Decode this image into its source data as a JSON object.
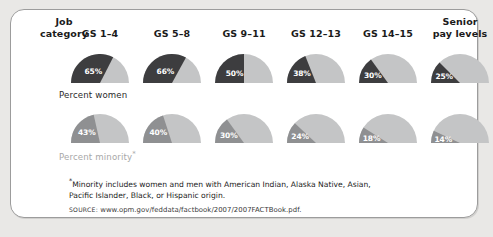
{
  "chart_data": {
    "type": "pie",
    "title": "",
    "subtitle": "",
    "xlabel": "",
    "ylabel": "",
    "categories": [
      "GS 1–4",
      "GS 5–8",
      "GS 9–11",
      "GS 12–13",
      "GS 14–15",
      "Senior pay levels"
    ],
    "series": [
      {
        "name": "Percent women",
        "values": [
          65,
          66,
          50,
          38,
          30,
          25
        ],
        "labels": [
          "65%",
          "66%",
          "50%",
          "38%",
          "30%",
          "25%"
        ],
        "color": "#3d3d3f"
      },
      {
        "name": "Percent minority*",
        "values": [
          43,
          40,
          30,
          24,
          18,
          14
        ],
        "labels": [
          "43%",
          "40%",
          "30%",
          "24%",
          "18%",
          "14%"
        ],
        "color": "#8f9092"
      }
    ],
    "track_color": "#c4c5c6",
    "gauge_shape": "semicircle",
    "gauge_sweep_degrees": 180,
    "gauge_start": "left-horizontal-clockwise",
    "value_units": "percent",
    "ylim": [
      0,
      100
    ],
    "grid": false,
    "legend": "none"
  },
  "card": {
    "background": "#ffffff",
    "border_color": "#9c9c9c",
    "page_background": "#e9e8e6"
  },
  "header": {
    "category_label_line1": "Job",
    "category_label_line2": "category",
    "columns": [
      {
        "line1": "GS 1–4",
        "line2": ""
      },
      {
        "line1": "GS 5–8",
        "line2": ""
      },
      {
        "line1": "GS 9–11",
        "line2": ""
      },
      {
        "line1": "GS 12–13",
        "line2": ""
      },
      {
        "line1": "GS 14–15",
        "line2": ""
      },
      {
        "line1": "Senior",
        "line2": "pay levels"
      }
    ]
  },
  "rows": [
    {
      "label": "Percent women",
      "footnote_marker": "",
      "label_color": "#2a2a2a",
      "wedge_color": "#3d3d3f",
      "cells": [
        {
          "category": "GS 1–4",
          "value": 65,
          "label": "65%"
        },
        {
          "category": "GS 5–8",
          "value": 66,
          "label": "66%"
        },
        {
          "category": "GS 9–11",
          "value": 50,
          "label": "50%"
        },
        {
          "category": "GS 12–13",
          "value": 38,
          "label": "38%"
        },
        {
          "category": "GS 14–15",
          "value": 30,
          "label": "30%"
        },
        {
          "category": "Senior pay levels",
          "value": 25,
          "label": "25%"
        }
      ]
    },
    {
      "label": "Percent minority",
      "footnote_marker": "*",
      "label_color": "#a8a8a8",
      "wedge_color": "#8f9092",
      "cells": [
        {
          "category": "GS 1–4",
          "value": 43,
          "label": "43%"
        },
        {
          "category": "GS 5–8",
          "value": 40,
          "label": "40%"
        },
        {
          "category": "GS 9–11",
          "value": 30,
          "label": "30%"
        },
        {
          "category": "GS 12–13",
          "value": 24,
          "label": "24%"
        },
        {
          "category": "GS 14–15",
          "value": 18,
          "label": "18%"
        },
        {
          "category": "Senior pay levels",
          "value": 14,
          "label": "14%"
        }
      ]
    }
  ],
  "notes": {
    "footnote_marker": "*",
    "footnote_line1": "Minority includes women and men with American Indian, Alaska Native, Asian,",
    "footnote_line2": "Pacific Islander, Black, or Hispanic origin.",
    "source_label": "SOURCE:",
    "source_value": "www.opm.gov/feddata/factbook/2007/2007FACTBook.pdf."
  }
}
